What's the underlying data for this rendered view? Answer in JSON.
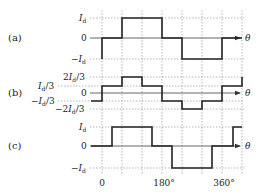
{
  "figure": {
    "panels": [
      {
        "id": "a",
        "label": "(a)",
        "axis_label": "θ",
        "levels": [
          {
            "text": "I",
            "sub": "d",
            "prefix": "",
            "suffix": "",
            "value": "Id"
          },
          {
            "text": "0",
            "value": "0"
          },
          {
            "text": "I",
            "sub": "d",
            "prefix": "−",
            "suffix": "",
            "value": "-Id"
          }
        ],
        "waveform": "quasi-square wave: -Id before 0°, 0 from 0°–60°, Id from 60°–180°, 0 from 180°–240°, -Id from 240°–360°, 0 from 360°–420°"
      },
      {
        "id": "b",
        "label": "(b)",
        "axis_label": "θ",
        "levels": [
          {
            "text": "2I",
            "sub": "d",
            "suffix": "/3",
            "value": "2Id/3"
          },
          {
            "text": "I",
            "sub": "d",
            "suffix": "/3",
            "value": "Id/3"
          },
          {
            "text": "0",
            "value": "0"
          },
          {
            "text": "I",
            "sub": "d",
            "prefix": "−",
            "suffix": "/3",
            "value": "-Id/3"
          },
          {
            "text": "2I",
            "sub": "d",
            "prefix": "−",
            "suffix": "/3",
            "value": "-2Id/3"
          }
        ],
        "waveform": "six-step wave: -Id/3 before 0°, Id/3 0°–60°, 2Id/3 60°–120°, Id/3 120°–180°, -Id/3 180°–240°, -2Id/3 240°–300°, -Id/3 300°–360°, Id/3 360°–420°, rising to 2Id/3 at 420°"
      },
      {
        "id": "c",
        "label": "(c)",
        "axis_label": "θ",
        "levels": [
          {
            "text": "I",
            "sub": "d",
            "value": "Id"
          },
          {
            "text": "0",
            "value": "0"
          },
          {
            "text": "I",
            "sub": "d",
            "prefix": "−",
            "value": "-Id"
          }
        ],
        "waveform": "quasi-square wave shifted +30°: 0 until 30°, Id 30°–150°, 0 150°–210°, -Id 210°–330°, 0 330°–390°, Id from 390°"
      }
    ],
    "x_ticks": [
      {
        "label": "0",
        "deg": 0
      },
      {
        "label": "180°",
        "deg": 180
      },
      {
        "label": "360°",
        "deg": 360
      }
    ],
    "grid_step_deg": 60
  }
}
